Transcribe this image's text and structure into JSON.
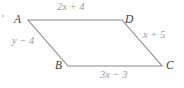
{
  "figure": {
    "kind": "parallelogram",
    "bullet_mark": "•",
    "stroke_color": "#8a8a8a",
    "vertex_text_color": "#3c3c3c",
    "side_text_color": "#9b9b9b",
    "background_color": "#ffffff",
    "vertices": [
      {
        "id": "A",
        "label": "A",
        "x": 28,
        "y": 20
      },
      {
        "id": "D",
        "label": "D",
        "x": 122,
        "y": 20
      },
      {
        "id": "C",
        "label": "C",
        "x": 162,
        "y": 66
      },
      {
        "id": "B",
        "label": "B",
        "x": 68,
        "y": 66
      }
    ],
    "sides": [
      {
        "id": "AD",
        "from": "A",
        "to": "D",
        "label": "2x + 4"
      },
      {
        "id": "DC",
        "from": "D",
        "to": "C",
        "label": "x + 5"
      },
      {
        "id": "BC",
        "from": "B",
        "to": "C",
        "label": "3x − 3"
      },
      {
        "id": "AB",
        "from": "A",
        "to": "B",
        "label": "y − 4"
      }
    ],
    "outline_points": "28,20 122,20 162,66 68,66"
  }
}
